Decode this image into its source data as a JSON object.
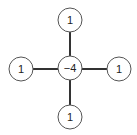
{
  "diagram": {
    "type": "laplacian-stencil",
    "center": {
      "label": "−4"
    },
    "neighbors": {
      "top": {
        "label": "1"
      },
      "left": {
        "label": "1"
      },
      "right": {
        "label": "1"
      },
      "bottom": {
        "label": "1"
      }
    }
  }
}
